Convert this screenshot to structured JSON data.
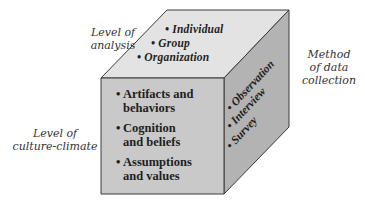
{
  "diagram": {
    "type": "3d-cube",
    "colors": {
      "top_face": "#e3e3e3",
      "front_face": "#c9c9c9",
      "right_face": "#b3b3b3",
      "edge": "#3a3a3a",
      "text": "#1e1e1e",
      "label_text": "#333333"
    },
    "axis_labels": {
      "level_of_analysis": [
        "Level of",
        "analysis"
      ],
      "method_of_data_collection": [
        "Method",
        "of data",
        "collection"
      ],
      "level_of_culture_climate": [
        "Level of",
        "culture-climate"
      ]
    },
    "top_face": {
      "bullet": "•",
      "items": [
        "Individual",
        "Group",
        "Organization"
      ]
    },
    "front_face": {
      "bullet": "•",
      "items": [
        [
          "Artifacts and",
          "behaviors"
        ],
        [
          "Cognition",
          "and beliefs"
        ],
        [
          "Assumptions",
          "and values"
        ]
      ]
    },
    "right_face": {
      "bullet": "•",
      "items": [
        "Observation",
        "Interview",
        "Survey"
      ]
    }
  }
}
